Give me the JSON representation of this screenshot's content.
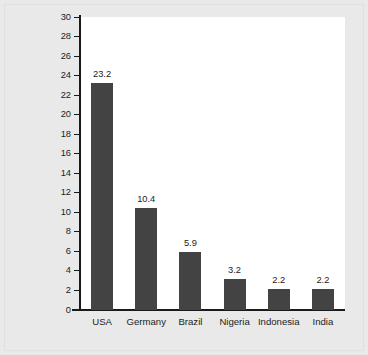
{
  "chart_data": {
    "type": "bar",
    "title": "",
    "xlabel": "",
    "ylabel": "Acres of Land Required to Support an Individual at Standard of Living of Population",
    "ylabel_lines": [
      "Acres of Land Required to Support an",
      "Individual at Standard of Living of Population"
    ],
    "categories": [
      "USA",
      "Germany",
      "Brazil",
      "Nigeria",
      "Indonesia",
      "India"
    ],
    "values": [
      23.2,
      10.4,
      5.9,
      3.2,
      2.2,
      2.2
    ],
    "value_labels": [
      "23.2",
      "10.4",
      "5.9",
      "3.2",
      "2.2",
      "2.2"
    ],
    "ylim": [
      0,
      30
    ],
    "ytick_step": 2,
    "yticks": [
      30,
      28,
      26,
      24,
      22,
      20,
      18,
      16,
      14,
      12,
      10,
      8,
      6,
      4,
      2,
      0
    ],
    "ytick_labels": [
      "30",
      "28",
      "26",
      "24",
      "22",
      "20",
      "18",
      "16",
      "14",
      "12",
      "10",
      "8",
      "6",
      "4",
      "2",
      "0"
    ],
    "grid": false,
    "legend": false,
    "bar_color": "#434343",
    "plot_background": "#ffffff",
    "page_background": "#e9e9e9",
    "axis_color": "#1a1a1a",
    "text_color": "#1c1c1c"
  }
}
